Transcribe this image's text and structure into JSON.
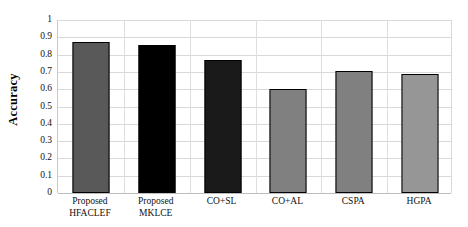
{
  "chart_data": {
    "type": "bar",
    "title": "",
    "xlabel": "",
    "ylabel": "Accuracy",
    "ylim": [
      0,
      1
    ],
    "ytick_step": 0.1,
    "grid": "horizontal-and-vertical",
    "legend": "none",
    "categories": [
      "Proposed HFACLEF",
      "Proposed MKLCE",
      "CO+SL",
      "CO+AL",
      "CSPA",
      "HGPA"
    ],
    "category_lines": [
      [
        "Proposed",
        "HFACLEF"
      ],
      [
        "Proposed",
        "MKLCE"
      ],
      [
        "CO+SL",
        ""
      ],
      [
        "CO+AL",
        ""
      ],
      [
        "CSPA",
        ""
      ],
      [
        "HGPA",
        ""
      ]
    ],
    "values": [
      0.875,
      0.855,
      0.77,
      0.6,
      0.705,
      0.69
    ],
    "bar_colors": [
      "#595959",
      "#000000",
      "#1a1a1a",
      "#808080",
      "#808080",
      "#969696"
    ],
    "bar_edge_color": "#000000",
    "ytick_labels": [
      "1",
      "0.9",
      "0.8",
      "0.7",
      "0.6",
      "0.5",
      "0.4",
      "0.3",
      "0.2",
      "0.1",
      "0"
    ],
    "ytick_values": [
      1,
      0.9,
      0.8,
      0.7,
      0.6,
      0.5,
      0.4,
      0.3,
      0.2,
      0.1,
      0
    ]
  },
  "axis": {
    "y_title": "Accuracy"
  }
}
